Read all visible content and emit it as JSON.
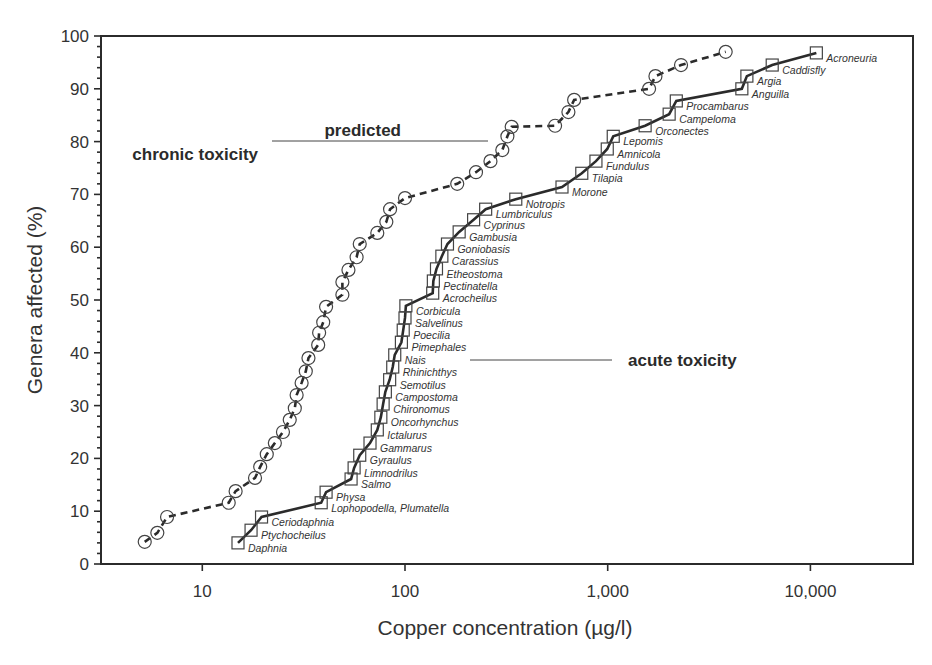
{
  "chart_data": {
    "type": "line",
    "title": "",
    "xlabel": "Copper concentration (µg/l)",
    "ylabel": "Genera affected (%)",
    "xscale": "log",
    "xlim": [
      3.3,
      35000
    ],
    "ylim": [
      0,
      100
    ],
    "x_ticks": [
      10,
      100,
      1000,
      10000
    ],
    "x_tick_labels": [
      "10",
      "100",
      "1,000",
      "10,000"
    ],
    "y_ticks": [
      0,
      10,
      20,
      30,
      40,
      50,
      60,
      70,
      80,
      90,
      100
    ],
    "y_tick_labels": [
      "0",
      "10",
      "20",
      "30",
      "40",
      "50",
      "60",
      "70",
      "80",
      "90",
      "100"
    ],
    "grid": false,
    "legend": "inline annotations",
    "series": [
      {
        "name": "predicted chronic toxicity",
        "marker": "circle",
        "line_style": "dashed",
        "label_lines": [
          "predicted",
          "chronic toxicity"
        ],
        "points": [
          [
            5.2,
            4.2
          ],
          [
            6.0,
            5.9
          ],
          [
            6.7,
            8.9
          ],
          [
            13.5,
            11.6
          ],
          [
            14.6,
            13.8
          ],
          [
            18.2,
            16.3
          ],
          [
            19.3,
            18.4
          ],
          [
            20.8,
            20.8
          ],
          [
            22.8,
            22.9
          ],
          [
            25.0,
            25.0
          ],
          [
            27.0,
            27.3
          ],
          [
            28.6,
            29.5
          ],
          [
            29.2,
            32.0
          ],
          [
            30.9,
            34.3
          ],
          [
            32.4,
            36.5
          ],
          [
            33.4,
            39.0
          ],
          [
            37.3,
            41.5
          ],
          [
            37.7,
            43.8
          ],
          [
            39.5,
            45.8
          ],
          [
            40.8,
            48.7
          ],
          [
            49.1,
            51.0
          ],
          [
            49.1,
            53.4
          ],
          [
            52.6,
            55.7
          ],
          [
            57.7,
            58.1
          ],
          [
            59.8,
            60.6
          ],
          [
            73.0,
            62.7
          ],
          [
            80.9,
            64.8
          ],
          [
            84.4,
            67.2
          ],
          [
            100.0,
            69.3
          ],
          [
            181.0,
            72.0
          ],
          [
            224.0,
            74.2
          ],
          [
            264.0,
            76.3
          ],
          [
            302.0,
            78.4
          ],
          [
            320.0,
            81.0
          ],
          [
            336.0,
            82.8
          ],
          [
            550.0,
            83.0
          ],
          [
            640.0,
            85.6
          ],
          [
            683.0,
            87.9
          ],
          [
            1600.0,
            90.0
          ],
          [
            1720.0,
            92.4
          ],
          [
            2300.0,
            94.5
          ],
          [
            3820.0,
            97.0
          ]
        ]
      },
      {
        "name": "acute toxicity",
        "marker": "square",
        "line_style": "solid",
        "label_lines": [
          "acute toxicity"
        ],
        "points": [
          {
            "genus": "Daphnia",
            "x": 15.0,
            "y": 4.0
          },
          {
            "genus": "Ptychocheilus",
            "x": 17.4,
            "y": 6.4
          },
          {
            "genus": "Ceriodaphnia",
            "x": 19.6,
            "y": 8.9
          },
          {
            "genus": "Lophopodella, Plumatella",
            "x": 38.6,
            "y": 11.6
          },
          {
            "genus": "Physa",
            "x": 40.8,
            "y": 13.6
          },
          {
            "genus": "Salmo",
            "x": 54.2,
            "y": 16.1
          },
          {
            "genus": "Limnodrilus",
            "x": 56.1,
            "y": 18.2
          },
          {
            "genus": "Gyraulus",
            "x": 59.8,
            "y": 20.6
          },
          {
            "genus": "Gammarus",
            "x": 67.2,
            "y": 22.9
          },
          {
            "genus": "Ictalurus",
            "x": 73.0,
            "y": 25.4
          },
          {
            "genus": "Oncorhynchus",
            "x": 76.0,
            "y": 27.8
          },
          {
            "genus": "Chironomus",
            "x": 78.0,
            "y": 30.3
          },
          {
            "genus": "Campostoma",
            "x": 80.0,
            "y": 32.6
          },
          {
            "genus": "Semotilus",
            "x": 84.0,
            "y": 34.9
          },
          {
            "genus": "Rhinichthys",
            "x": 87.0,
            "y": 37.3
          },
          {
            "genus": "Nais",
            "x": 89.0,
            "y": 39.6
          },
          {
            "genus": "Pimephales",
            "x": 96.0,
            "y": 42.0
          },
          {
            "genus": "Poecilia",
            "x": 98.0,
            "y": 44.3
          },
          {
            "genus": "Salvelinus",
            "x": 100.0,
            "y": 46.6
          },
          {
            "genus": "Corbicula",
            "x": 101.0,
            "y": 48.9
          },
          {
            "genus": "Acrocheilus",
            "x": 137.0,
            "y": 51.3
          },
          {
            "genus": "Pectinatella",
            "x": 138.0,
            "y": 53.6
          },
          {
            "genus": "Etheostoma",
            "x": 143.0,
            "y": 55.9
          },
          {
            "genus": "Carassius",
            "x": 152.0,
            "y": 58.3
          },
          {
            "genus": "Goniobasis",
            "x": 162.0,
            "y": 60.6
          },
          {
            "genus": "Gambusia",
            "x": 185.0,
            "y": 62.9
          },
          {
            "genus": "Cyprinus",
            "x": 218.0,
            "y": 65.2
          },
          {
            "genus": "Lumbriculus",
            "x": 250.0,
            "y": 67.2
          },
          {
            "genus": "Notropis",
            "x": 352.0,
            "y": 69.1
          },
          {
            "genus": "Morone",
            "x": 595.0,
            "y": 71.4
          },
          {
            "genus": "Tilapia",
            "x": 745.0,
            "y": 74.0
          },
          {
            "genus": "Fundulus",
            "x": 875.0,
            "y": 76.3
          },
          {
            "genus": "Amnicola",
            "x": 995.0,
            "y": 78.6
          },
          {
            "genus": "Lepomis",
            "x": 1065.0,
            "y": 81.0
          },
          {
            "genus": "Orconectes",
            "x": 1530.0,
            "y": 83.0
          },
          {
            "genus": "Campeloma",
            "x": 2010.0,
            "y": 85.2
          },
          {
            "genus": "Procambarus",
            "x": 2180.0,
            "y": 87.7
          },
          {
            "genus": "Anguilla",
            "x": 4590.0,
            "y": 90.0
          },
          {
            "genus": "Argia",
            "x": 4860.0,
            "y": 92.4
          },
          {
            "genus": "Caddisfly",
            "x": 6480.0,
            "y": 94.5
          },
          {
            "genus": "Acroneuria",
            "x": 10700.0,
            "y": 96.8
          }
        ]
      }
    ],
    "annotations": [
      {
        "text": "predicted chronic toxicity",
        "points_to": "predicted chronic toxicity curve"
      },
      {
        "text": "acute toxicity",
        "points_to": "acute toxicity curve"
      }
    ]
  },
  "labels": {
    "chronic_line1": "predicted",
    "chronic_line2": "chronic toxicity",
    "acute": "acute toxicity",
    "xlabel": "Copper concentration (µg/l)",
    "ylabel": "Genera affected (%)"
  },
  "colors": {
    "ink": "#2b2b2b",
    "axis": "#333333",
    "background": "#ffffff"
  }
}
